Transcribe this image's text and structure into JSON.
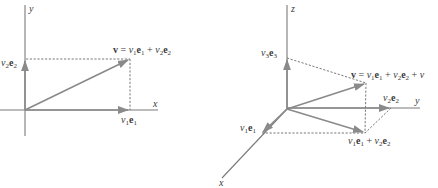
{
  "left_diagram": {
    "title": "2D vector decomposition",
    "axis_x_label": "x",
    "axis_y_label": "y",
    "vector_label": {
      "v": "v",
      "eq": " = ",
      "v1": "v",
      "sub1": "1",
      "e1": "e",
      "esub1": "1",
      "plus": " + ",
      "v2": "v",
      "sub2": "2",
      "e2": "e",
      "esub2": "2"
    },
    "component_x": {
      "v": "v",
      "sub": "1",
      "e": "e",
      "esub": "1"
    },
    "component_y": {
      "v": "v",
      "sub": "2",
      "e": "e",
      "esub": "2"
    }
  },
  "right_diagram": {
    "title": "3D vector decomposition",
    "axis_x_label": "x",
    "axis_y_label": "y",
    "axis_z_label": "z",
    "vector_label": {
      "v": "v",
      "eq": " = ",
      "v1": "v",
      "sub1": "1",
      "e1": "e",
      "esub1": "1",
      "plus1": " + ",
      "v2": "v",
      "sub2": "2",
      "e2": "e",
      "esub2": "2",
      "plus2": " + ",
      "v3": "v"
    },
    "component_x": {
      "v": "v",
      "sub": "1",
      "e": "e",
      "esub": "1"
    },
    "component_y": {
      "v": "v",
      "sub": "2",
      "e": "e",
      "esub": "2"
    },
    "component_z": {
      "v": "v",
      "sub": "3",
      "e": "e",
      "esub": "3"
    },
    "sum_xy": {
      "v1": "v",
      "sub1": "1",
      "e1": "e",
      "esub1": "1",
      "plus": " + ",
      "v2": "v",
      "sub2": "2",
      "e2": "e",
      "esub2": "2"
    }
  },
  "colors": {
    "axis": "#7a7a7a",
    "vector": "#8a8a8a",
    "dashed": "#6a6a6a",
    "text": "#3a3a3a",
    "background": "#ffffff"
  }
}
